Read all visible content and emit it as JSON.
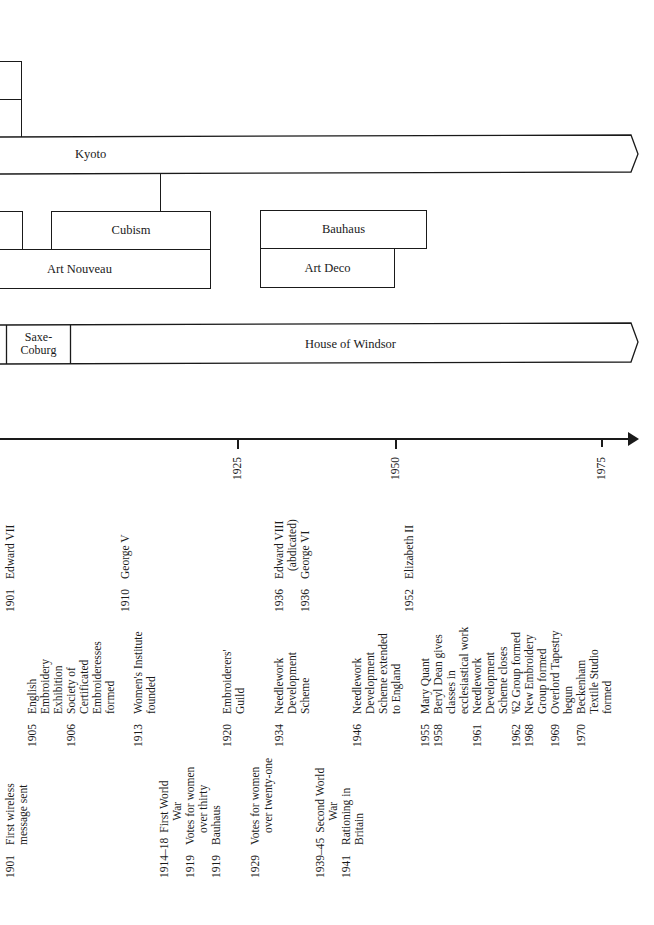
{
  "bands": {
    "japan_era": {
      "label": "Kyoto"
    },
    "art_movements": {
      "cubism": "Cubism",
      "art_nouveau": "Art Nouveau",
      "bauhaus": "Bauhaus",
      "art_deco": "Art Deco"
    },
    "royal_houses": {
      "saxe_coburg": [
        "Saxe-",
        "Coburg"
      ],
      "windsor": "House of Windsor"
    }
  },
  "axis": {
    "ticks": [
      "1925",
      "1950",
      "1975"
    ]
  },
  "monarchs": [
    {
      "year": "1901",
      "lines": [
        "Edward VII"
      ]
    },
    {
      "year": "1910",
      "lines": [
        "George V"
      ]
    },
    {
      "year": "1936",
      "lines": [
        "Edward VIII",
        "(abdicated)"
      ]
    },
    {
      "year": "1936",
      "lines": [
        "George VI"
      ]
    },
    {
      "year": "1952",
      "lines": [
        "Elizabeth II"
      ]
    }
  ],
  "embroidery_events": [
    {
      "year": "1905",
      "lines": [
        "English",
        "Embroidery",
        "Exhibition"
      ]
    },
    {
      "year": "1906",
      "lines": [
        "Society of",
        "Certificated",
        "Embroideresses",
        "formed"
      ]
    },
    {
      "year": "1913",
      "lines": [
        "Women's Institute",
        "founded"
      ]
    },
    {
      "year": "1920",
      "lines": [
        "Embroiderers'",
        "Guild"
      ]
    },
    {
      "year": "1934",
      "lines": [
        "Needlework",
        "Development",
        "Scheme"
      ]
    },
    {
      "year": "1946",
      "lines": [
        "Needlework",
        "Development",
        "Scheme extended",
        "to England"
      ]
    },
    {
      "year": "1955",
      "lines": [
        "Mary Quant"
      ]
    },
    {
      "year": "1958",
      "lines": [
        "Beryl Dean gives",
        "classes in",
        "ecclesiastical work"
      ]
    },
    {
      "year": "1961",
      "lines": [
        "Needlework",
        "Development",
        "Scheme closes"
      ]
    },
    {
      "year": "1962",
      "lines": [
        "'62 Group formed"
      ]
    },
    {
      "year": "1968",
      "lines": [
        "New Embroidery",
        "Group formed"
      ]
    },
    {
      "year": "1969",
      "lines": [
        "Overlord Tapestry",
        "begun"
      ]
    },
    {
      "year": "1970",
      "lines": [
        "Beckenham",
        "Textile Studio",
        "formed"
      ]
    }
  ],
  "world_events": [
    {
      "year": "1901",
      "lines": [
        "First wireless",
        "message sent"
      ]
    },
    {
      "year": "1914–18",
      "lines": [
        "First World",
        "War"
      ]
    },
    {
      "year": "1919",
      "lines": [
        "Votes for women",
        "over thirty"
      ]
    },
    {
      "year": "1919",
      "lines": [
        "Bauhaus"
      ]
    },
    {
      "year": "1929",
      "lines": [
        "Votes for women",
        "over twenty-one"
      ]
    },
    {
      "year": "1939–45",
      "lines": [
        "Second World",
        "War"
      ]
    },
    {
      "year": "1941",
      "lines": [
        "Rationing in",
        "Britain"
      ]
    }
  ]
}
